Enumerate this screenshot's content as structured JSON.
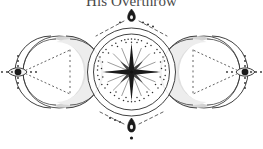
{
  "page": {
    "background_color": "#ffffff",
    "ink_color": "#2b2b2b",
    "shade_color": "#9a9a9a"
  },
  "title": {
    "text": "His Overthrow",
    "clipped_at_top": true
  },
  "emblem": {
    "name": "triple-moon-star-emblem",
    "description": "Symmetric occult emblem: left crescent moon in circle, central star in dotted double circle, right crescent moon in circle, with teardrop ornaments top and bottom",
    "center_circle": {
      "cx": 131.5,
      "cy": 72,
      "outer_radius": 44,
      "inner_radius": 38,
      "dot_ring_radius": 33
    },
    "star": {
      "name": "eight-pointed-star",
      "cx": 131.5,
      "cy": 72,
      "long_point_radius": 29,
      "short_point_radius": 16,
      "ray_radius": 26,
      "points": 8
    },
    "left_moon": {
      "name": "left-crescent-moon",
      "circle_cx": 59,
      "circle_cy": 72,
      "circle_radius": 36,
      "crescent_opening": "left"
    },
    "right_moon": {
      "name": "right-crescent-moon",
      "circle_cx": 204,
      "circle_cy": 72,
      "circle_radius": 36,
      "crescent_opening": "right"
    },
    "left_eye": {
      "name": "left-eye-ornament",
      "cx": 17,
      "cy": 72
    },
    "right_eye": {
      "name": "right-eye-ornament",
      "cx": 246,
      "cy": 72
    },
    "top_ornament": {
      "name": "top-teardrop-ornament",
      "cx": 131.5,
      "cy": 15
    },
    "bottom_ornament": {
      "name": "bottom-teardrop-ornament",
      "cx": 131.5,
      "cy": 127
    }
  }
}
